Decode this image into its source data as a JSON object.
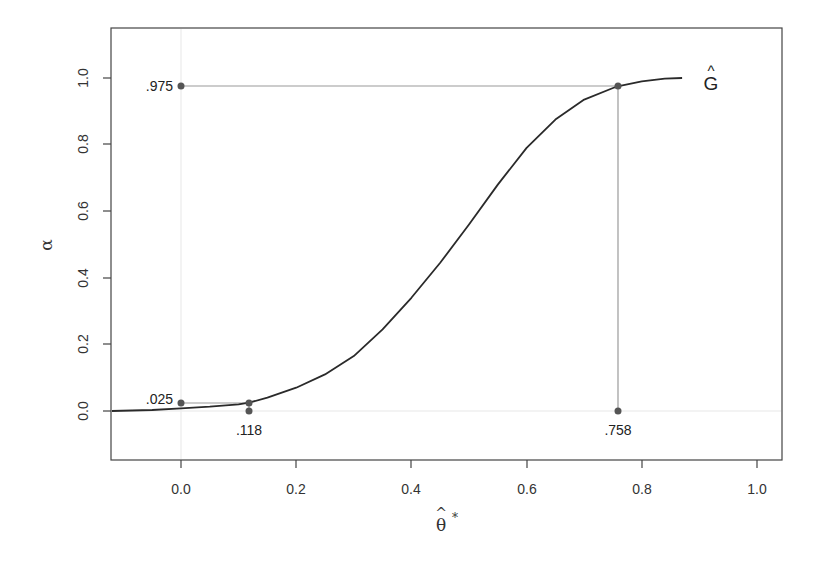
{
  "chart_data": {
    "type": "line",
    "title": "",
    "xlabel": "θ̂*",
    "ylabel": "α",
    "xlim": [
      -0.12,
      1.04
    ],
    "ylim": [
      -0.15,
      1.15
    ],
    "grid": false,
    "legend": null,
    "x_ticks": [
      "0.0",
      "0.2",
      "0.4",
      "0.6",
      "0.8",
      "1.0"
    ],
    "y_ticks": [
      "0.0",
      "0.2",
      "0.4",
      "0.6",
      "0.8",
      "1.0"
    ],
    "series": [
      {
        "name": "Ĝ",
        "label": "Ĝ",
        "x": [
          -0.12,
          -0.05,
          0.0,
          0.05,
          0.1,
          0.118,
          0.15,
          0.2,
          0.25,
          0.3,
          0.35,
          0.4,
          0.45,
          0.5,
          0.55,
          0.6,
          0.65,
          0.7,
          0.75,
          0.758,
          0.8,
          0.84,
          0.87
        ],
        "y": [
          0.0,
          0.003,
          0.008,
          0.013,
          0.02,
          0.025,
          0.04,
          0.07,
          0.11,
          0.165,
          0.245,
          0.34,
          0.445,
          0.56,
          0.68,
          0.79,
          0.875,
          0.935,
          0.97,
          0.975,
          0.99,
          0.998,
          1.0
        ]
      }
    ],
    "reference_lines": [
      {
        "type": "horizontal",
        "y": 0.975,
        "x_from": 0.0,
        "x_to": 0.758
      },
      {
        "type": "horizontal",
        "y": 0.025,
        "x_from": 0.0,
        "x_to": 0.118
      },
      {
        "type": "vertical",
        "x": 0.758,
        "y_from": 0.0,
        "y_to": 0.975
      },
      {
        "type": "vertical",
        "x": 0.118,
        "y_from": 0.0,
        "y_to": 0.025
      }
    ],
    "points": [
      {
        "x": 0.0,
        "y": 0.975,
        "label": ".975",
        "label_pos": "left"
      },
      {
        "x": 0.758,
        "y": 0.975,
        "label": "",
        "label_pos": "none"
      },
      {
        "x": 0.0,
        "y": 0.025,
        "label": ".025",
        "label_pos": "left"
      },
      {
        "x": 0.118,
        "y": 0.025,
        "label": "",
        "label_pos": "none"
      },
      {
        "x": 0.118,
        "y": 0.0,
        "label": ".118",
        "label_pos": "below"
      },
      {
        "x": 0.758,
        "y": 0.0,
        "label": ".758",
        "label_pos": "below"
      }
    ],
    "annotations": [
      {
        "text": ".975",
        "x": 0.0,
        "y": 0.975
      },
      {
        "text": ".025",
        "x": 0.0,
        "y": 0.025
      },
      {
        "text": ".118",
        "x": 0.118,
        "y": 0.0
      },
      {
        "text": ".758",
        "x": 0.758,
        "y": 0.0
      },
      {
        "text": "Ĝ",
        "x": 0.95,
        "y": 1.0
      }
    ],
    "colors": {
      "curve": "#2a2a2a",
      "reference": "#9a9a9a",
      "points": "#555555",
      "axis": "#444444",
      "faint_gridline": "#ececec"
    }
  },
  "labels": {
    "x_axis": "θ",
    "x_axis_hat": "^",
    "x_axis_star": "*",
    "y_axis": "α",
    "curve_name": "G",
    "curve_hat": "^",
    "annot_975": ".975",
    "annot_025": ".025",
    "annot_118": ".118",
    "annot_758": ".758",
    "xtick_0": "0.0",
    "xtick_1": "0.2",
    "xtick_2": "0.4",
    "xtick_3": "0.6",
    "xtick_4": "0.8",
    "xtick_5": "1.0",
    "ytick_0": "0.0",
    "ytick_1": "0.2",
    "ytick_2": "0.4",
    "ytick_3": "0.6",
    "ytick_4": "0.8",
    "ytick_5": "1.0"
  }
}
